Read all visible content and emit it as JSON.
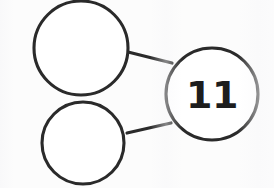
{
  "diagram": {
    "type": "number-bond",
    "background_color": "#fcfcfc",
    "stroke_color": "#2a2a2a",
    "text_color": "#1d1d1d",
    "nodes": [
      {
        "id": "part-top",
        "role": "part",
        "label": "",
        "filled": false,
        "cx": 81,
        "cy": 48,
        "r": 47
      },
      {
        "id": "part-bottom",
        "role": "part",
        "label": "",
        "filled": false,
        "cx": 83,
        "cy": 143,
        "r": 41
      },
      {
        "id": "whole",
        "role": "whole",
        "label": "11",
        "filled": true,
        "cx": 212,
        "cy": 94,
        "r": 46
      }
    ],
    "edges": [
      {
        "id": "edge-top",
        "from": "part-top",
        "to": "whole",
        "x1": 128,
        "y1": 52,
        "x2": 172,
        "y2": 63
      },
      {
        "id": "edge-bottom",
        "from": "part-bottom",
        "to": "whole",
        "x1": 127,
        "y1": 133,
        "x2": 171,
        "y2": 123
      }
    ]
  }
}
